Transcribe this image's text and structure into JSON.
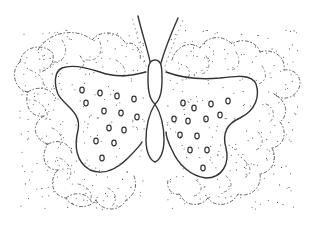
{
  "image": {
    "subject": "butterfly line drawing",
    "style": "coloring-page outline with dotted stipple, circle spots and lacy dashed scalloped wing edges",
    "colors": {
      "background": "#ffffff",
      "ink": "#333333",
      "lace": "#555555"
    },
    "left_wing_spots": [
      [
        82,
        90
      ],
      [
        100,
        93
      ],
      [
        117,
        96
      ],
      [
        134,
        99
      ],
      [
        86,
        103
      ],
      [
        104,
        111
      ],
      [
        121,
        113
      ],
      [
        137,
        117
      ],
      [
        109,
        128
      ],
      [
        124,
        130
      ],
      [
        96,
        141
      ],
      [
        114,
        143
      ],
      [
        102,
        158
      ]
    ],
    "right_wing_spots": [
      [
        183,
        103
      ],
      [
        194,
        108
      ],
      [
        211,
        104
      ],
      [
        228,
        101
      ],
      [
        174,
        119
      ],
      [
        188,
        121
      ],
      [
        206,
        119
      ],
      [
        220,
        115
      ],
      [
        180,
        135
      ],
      [
        197,
        136
      ],
      [
        190,
        150
      ],
      [
        207,
        150
      ],
      [
        203,
        168
      ]
    ]
  }
}
